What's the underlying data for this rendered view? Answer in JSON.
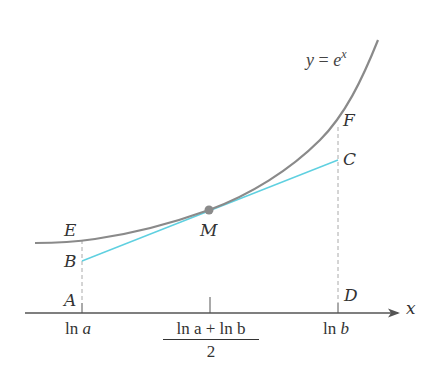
{
  "figure": {
    "curve_label": {
      "lhs": "y",
      "eq": " = ",
      "base": "e",
      "exp": "x"
    },
    "axis_label": "x",
    "points": {
      "A": "A",
      "B": "B",
      "C": "C",
      "D": "D",
      "E": "E",
      "F": "F",
      "M": "M"
    },
    "ticks": {
      "left": {
        "fn": "ln ",
        "var": "a"
      },
      "mid": {
        "numerator": "ln a + ln b",
        "denominator": "2"
      },
      "right": {
        "fn": "ln ",
        "var": "b"
      }
    },
    "colors": {
      "curve": "#8a8a8a",
      "tangent": "#5fd0e0",
      "axis": "#555555",
      "dashed": "#aaaaaa",
      "point": "#8a8a8a"
    }
  }
}
